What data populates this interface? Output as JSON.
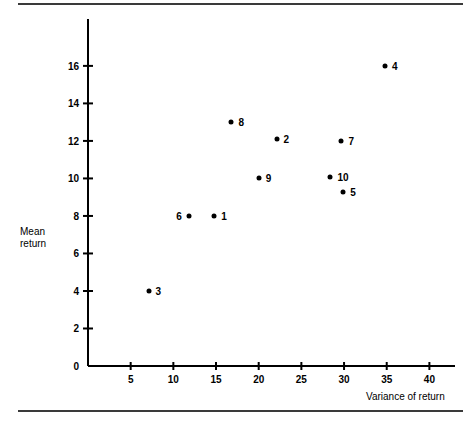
{
  "chart_data": {
    "type": "scatter",
    "title": "",
    "xlabel": "Variance of return",
    "ylabel": "Mean\nreturn",
    "xlim": [
      0,
      43
    ],
    "ylim": [
      0,
      18.5
    ],
    "xticks": [
      5,
      10,
      15,
      20,
      25,
      30,
      35,
      40
    ],
    "xtick_labels": [
      "5",
      "10",
      "15",
      "20",
      "25",
      "30",
      "35",
      "40"
    ],
    "yticks": [
      0,
      2,
      4,
      6,
      8,
      10,
      12,
      14,
      16
    ],
    "ytick_labels": [
      "0",
      "2",
      "4",
      "6",
      "8",
      "10",
      "12",
      "14",
      "16"
    ],
    "grid": false,
    "legend": null,
    "points": [
      {
        "label": "1",
        "x": 14.8,
        "y": 8.0,
        "label_side": "right"
      },
      {
        "label": "2",
        "x": 22.1,
        "y": 12.1,
        "label_side": "right"
      },
      {
        "label": "3",
        "x": 7.1,
        "y": 4.0,
        "label_side": "right"
      },
      {
        "label": "4",
        "x": 34.8,
        "y": 16.0,
        "label_side": "right"
      },
      {
        "label": "5",
        "x": 29.9,
        "y": 9.3,
        "label_side": "right"
      },
      {
        "label": "6",
        "x": 11.8,
        "y": 8.0,
        "label_side": "left"
      },
      {
        "label": "7",
        "x": 29.7,
        "y": 12.0,
        "label_side": "right"
      },
      {
        "label": "8",
        "x": 16.8,
        "y": 13.0,
        "label_side": "right"
      },
      {
        "label": "9",
        "x": 20.0,
        "y": 10.0,
        "label_side": "right"
      },
      {
        "label": "10",
        "x": 28.4,
        "y": 10.1,
        "label_side": "right"
      }
    ]
  },
  "colors": {
    "axis": "#000000",
    "marker": "#000000",
    "rule": "#3a3a3a",
    "background": "#ffffff"
  }
}
